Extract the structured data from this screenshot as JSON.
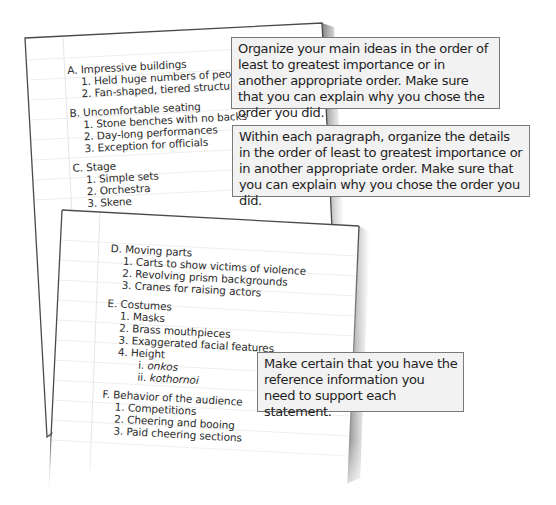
{
  "back_page": {
    "sections": [
      {
        "heading": "A. Impressive buildings",
        "items": [
          "1. Held huge numbers of people",
          "2. Fan-shaped, tiered structure"
        ]
      },
      {
        "heading": "B. Uncomfortable seating",
        "items": [
          "1. Stone benches with no backs",
          "2. Day-long performances",
          "3. Exception for officials"
        ]
      },
      {
        "heading": "C. Stage",
        "items": [
          "1. Simple sets",
          "2. Orchestra",
          "3. Skene"
        ]
      }
    ]
  },
  "front_page": {
    "sections": [
      {
        "heading": "D. Moving parts",
        "items": [
          "1. Carts to show victims of violence",
          "2. Revolving prism backgrounds",
          "3. Cranes for raising actors"
        ]
      },
      {
        "heading": "E. Costumes",
        "items": [
          "1. Masks",
          "2. Brass mouthpieces",
          "3. Exaggerated facial features",
          "4. Height"
        ],
        "subitems": [
          {
            "num": "i.",
            "text": "onkos"
          },
          {
            "num": "ii.",
            "text": "kothornoi"
          }
        ]
      },
      {
        "heading": "F. Behavior of the audience",
        "items": [
          "1. Competitions",
          "2. Cheering and booing",
          "3. Paid cheering sections"
        ]
      }
    ]
  },
  "callouts": [
    {
      "text": "Organize your main ideas in the order of least to greatest importance or in another appropriate order. Make sure that you can explain why you chose the order you did."
    },
    {
      "text": "Within each paragraph, organize the details in the order of least to greatest importance or in another appropriate order. Make sure that you can explain why you chose the order you did."
    },
    {
      "text": "Make certain that you have the reference information you need to support each statement."
    }
  ],
  "colors": {
    "paper": "#ffffff",
    "paper_edge": "#4a4a4a",
    "rule_line": "#ececec",
    "margin_line": "#e4e4e4",
    "callout_bg": "#f2f2f2",
    "callout_border": "#7a7a7a",
    "text": "#1e1e1e"
  }
}
